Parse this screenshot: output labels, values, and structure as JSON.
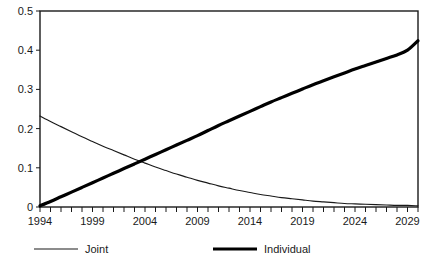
{
  "chart_data": {
    "type": "line",
    "title": "",
    "subtitle": "",
    "xlabel": "",
    "ylabel": "",
    "xlim": [
      1994,
      2030
    ],
    "ylim": [
      0,
      0.5
    ],
    "grid": false,
    "legend_position": "bottom",
    "x_tick_labels": [
      "1994",
      "1999",
      "2004",
      "2009",
      "2014",
      "2019",
      "2024",
      "2029"
    ],
    "x_tick_values": [
      1994,
      1999,
      2004,
      2009,
      2014,
      2019,
      2024,
      2029
    ],
    "x_minor_tick_interval": 1,
    "y_tick_labels": [
      "0",
      "0.1",
      "0.2",
      "0.3",
      "0.4",
      "0.5"
    ],
    "y_tick_values": [
      0,
      0.1,
      0.2,
      0.3,
      0.4,
      0.5
    ],
    "x": [
      1994,
      1995,
      1996,
      1997,
      1998,
      1999,
      2000,
      2001,
      2002,
      2003,
      2004,
      2005,
      2006,
      2007,
      2008,
      2009,
      2010,
      2011,
      2012,
      2013,
      2014,
      2015,
      2016,
      2017,
      2018,
      2019,
      2020,
      2021,
      2022,
      2023,
      2024,
      2025,
      2026,
      2027,
      2028,
      2029,
      2030
    ],
    "series": [
      {
        "name": "Joint",
        "line_style": "thin",
        "color": "#1a1a1a",
        "values": [
          0.232,
          0.218,
          0.205,
          0.192,
          0.179,
          0.167,
          0.155,
          0.144,
          0.133,
          0.122,
          0.112,
          0.102,
          0.093,
          0.084,
          0.076,
          0.068,
          0.061,
          0.054,
          0.048,
          0.042,
          0.037,
          0.032,
          0.028,
          0.024,
          0.021,
          0.018,
          0.015,
          0.013,
          0.011,
          0.009,
          0.008,
          0.007,
          0.006,
          0.005,
          0.004,
          0.004,
          0.003
        ]
      },
      {
        "name": "Individual",
        "line_style": "thick",
        "color": "#000000",
        "values": [
          0.003,
          0.014,
          0.026,
          0.038,
          0.05,
          0.062,
          0.074,
          0.086,
          0.098,
          0.11,
          0.122,
          0.134,
          0.146,
          0.158,
          0.17,
          0.182,
          0.195,
          0.208,
          0.22,
          0.232,
          0.244,
          0.256,
          0.268,
          0.279,
          0.29,
          0.301,
          0.312,
          0.322,
          0.332,
          0.342,
          0.352,
          0.361,
          0.37,
          0.379,
          0.388,
          0.4,
          0.424
        ]
      }
    ]
  },
  "legend": {
    "entries": [
      {
        "label": "Joint"
      },
      {
        "label": "Individual"
      }
    ]
  }
}
